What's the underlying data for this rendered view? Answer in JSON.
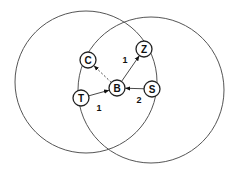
{
  "diagram": {
    "ranges": [
      {
        "id": "range-left",
        "cx": 86,
        "cy": 82,
        "r": 71
      },
      {
        "id": "range-right",
        "cx": 151,
        "cy": 90,
        "r": 73
      }
    ],
    "nodes": [
      {
        "id": "C",
        "label": "C",
        "x": 88,
        "y": 60
      },
      {
        "id": "Z",
        "label": "Z",
        "x": 144,
        "y": 49
      },
      {
        "id": "B",
        "label": "B",
        "x": 117,
        "y": 88
      },
      {
        "id": "T",
        "label": "T",
        "x": 81,
        "y": 98
      },
      {
        "id": "S",
        "label": "S",
        "x": 152,
        "y": 89
      }
    ],
    "edges": [
      {
        "from": "B",
        "to": "C",
        "style": "dashed",
        "label": ""
      },
      {
        "from": "B",
        "to": "Z",
        "style": "solid",
        "label": "1",
        "lx": 125,
        "ly": 60
      },
      {
        "from": "T",
        "to": "B",
        "style": "solid",
        "label": "1",
        "lx": 99,
        "ly": 108
      },
      {
        "from": "S",
        "to": "B",
        "style": "solid",
        "label": "2",
        "lx": 139,
        "ly": 100
      }
    ],
    "node_radius": 8
  }
}
